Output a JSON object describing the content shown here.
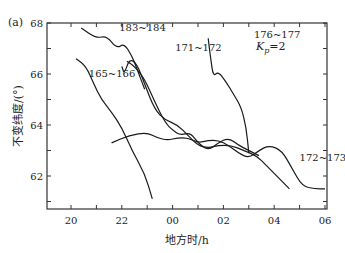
{
  "panel_label": "(a)",
  "annotation": "Kp=2",
  "annotation_main": "K",
  "annotation_sub": "p",
  "annotation_rest": "=2",
  "colors": {
    "line": "#1a1a1a",
    "axis": "#333333",
    "background": "#ffffff"
  },
  "chart_data": {
    "type": "line",
    "title": "",
    "xlabel": "地方时/h",
    "ylabel": "不变纬度/(°)",
    "xlim": [
      19.0,
      30.1
    ],
    "ylim": [
      60.8,
      68
    ],
    "x_ticks": [
      20,
      22,
      24,
      26,
      28,
      30
    ],
    "x_tick_labels": [
      "20",
      "22",
      "00",
      "02",
      "04",
      "06"
    ],
    "y_ticks": [
      62,
      64,
      66,
      68
    ],
    "y_tick_labels": [
      "62",
      "64",
      "66",
      "68"
    ],
    "grid": false,
    "legend": null,
    "annotations": [
      {
        "text": "Kp=2",
        "x": 28.3,
        "y": 66.9
      }
    ],
    "series": [
      {
        "name": "183~184",
        "label_pos": [
          21.9,
          67.7
        ],
        "x": [
          20.4,
          21.0,
          21.4,
          21.8,
          22.1,
          22.4,
          22.6,
          22.9
        ],
        "y": [
          67.8,
          67.4,
          67.5,
          67.0,
          67.2,
          66.7,
          66.2,
          65.4
        ]
      },
      {
        "name": "165~166",
        "label_pos": [
          20.7,
          65.9
        ],
        "x": [
          20.2,
          20.6,
          20.9,
          21.2,
          21.6,
          22.0,
          22.4,
          22.9,
          23.2
        ],
        "y": [
          66.6,
          66.3,
          65.6,
          65.0,
          64.5,
          63.9,
          63.0,
          62.1,
          61.1
        ]
      },
      {
        "name": "171~172",
        "label_pos": [
          24.1,
          66.9
        ],
        "x": [
          22.0,
          22.1,
          22.3,
          22.6,
          22.9,
          23.3,
          23.7,
          24.2,
          24.6,
          25.0,
          25.4,
          25.8,
          26.3,
          26.8,
          27.3,
          27.7,
          28.1,
          28.6
        ],
        "y": [
          66.3,
          66.0,
          66.6,
          66.4,
          65.6,
          64.6,
          64.2,
          64.0,
          63.6,
          63.2,
          63.1,
          63.2,
          63.2,
          63.0,
          62.8,
          62.4,
          62.0,
          61.5
        ]
      },
      {
        "name": "(mid branch)",
        "label_pos": null,
        "x": [
          22.2,
          22.5,
          22.9,
          23.3,
          23.7,
          24.0,
          24.3,
          24.7,
          25.0,
          25.4,
          25.8,
          26.2,
          26.6,
          27.0,
          27.4
        ],
        "y": [
          66.5,
          66.3,
          65.8,
          64.9,
          64.1,
          63.8,
          63.6,
          63.7,
          63.3,
          63.0,
          63.3,
          63.5,
          63.2,
          63.0,
          62.8
        ]
      },
      {
        "name": "176~177",
        "label_pos": [
          27.2,
          67.4
        ],
        "x": [
          25.4,
          25.5,
          25.6,
          25.8,
          26.1,
          26.4,
          26.7,
          26.9,
          27.0
        ],
        "y": [
          67.4,
          66.6,
          65.9,
          66.1,
          65.7,
          65.2,
          64.7,
          63.9,
          62.9
        ]
      },
      {
        "name": "172~173",
        "label_pos": [
          29.0,
          62.6
        ],
        "x": [
          21.6,
          22.3,
          23.0,
          23.4,
          23.8,
          24.2,
          24.6,
          25.0,
          25.4,
          25.8,
          26.2,
          26.6,
          27.0,
          27.4,
          27.8,
          28.3,
          28.7,
          29.1,
          29.6,
          30.0
        ],
        "y": [
          63.3,
          63.6,
          63.7,
          63.5,
          63.4,
          63.5,
          63.5,
          63.3,
          63.4,
          63.4,
          63.2,
          62.9,
          62.7,
          63.0,
          63.2,
          63.0,
          62.3,
          61.6,
          61.5,
          61.5
        ]
      }
    ]
  }
}
